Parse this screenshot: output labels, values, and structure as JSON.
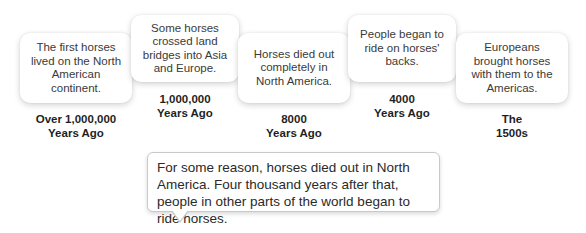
{
  "timeline": {
    "events": [
      {
        "description": "The first horses lived on the North American continent.",
        "time_line1": "Over 1,000,000",
        "time_line2": "Years Ago"
      },
      {
        "description": "Some horses crossed land bridges into Asia and Europe.",
        "time_line1": "1,000,000",
        "time_line2": "Years Ago"
      },
      {
        "description": "Horses died out completely in North America.",
        "time_line1": "8000",
        "time_line2": "Years Ago"
      },
      {
        "description": "People began to ride on horses' backs.",
        "time_line1": "4000",
        "time_line2": "Years Ago"
      },
      {
        "description": "Europeans brought horses with them to the Americas.",
        "time_line1": "The",
        "time_line2": "1500s"
      }
    ]
  },
  "callout": {
    "text": "For some reason, horses died out in North America. Four thousand years after that, people in other parts of the world began to ride horses."
  }
}
